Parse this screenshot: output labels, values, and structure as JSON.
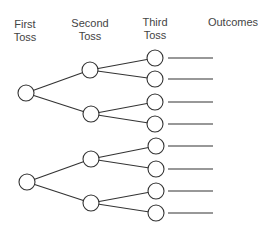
{
  "headers": {
    "first_toss": [
      "First",
      "Toss"
    ],
    "second_toss": [
      "Second",
      "Toss"
    ],
    "third_toss": [
      "Third",
      "Toss"
    ],
    "outcomes": "Outcomes"
  },
  "colors": {
    "stroke": "#333333",
    "node_fill": "#ffffff",
    "text": "#444444"
  },
  "diagram": {
    "type": "probability-tree",
    "node_radius": 8,
    "roots": [
      {
        "pos": [
          26,
          93
        ],
        "children": [
          {
            "pos": [
              90,
              70
            ],
            "children": [
              {
                "pos": [
                  155,
                  58
                ]
              },
              {
                "pos": [
                  155,
                  79
                ]
              }
            ]
          },
          {
            "pos": [
              91,
              114
            ],
            "children": [
              {
                "pos": [
                  155,
                  102
                ]
              },
              {
                "pos": [
                  155,
                  124
                ]
              }
            ]
          }
        ]
      },
      {
        "pos": [
          27,
          182
        ],
        "children": [
          {
            "pos": [
              91,
              159
            ],
            "children": [
              {
                "pos": [
                  156,
                  146
                ]
              },
              {
                "pos": [
                  156,
                  169
                ]
              }
            ]
          },
          {
            "pos": [
              91,
              203
            ],
            "children": [
              {
                "pos": [
                  156,
                  191
                ]
              },
              {
                "pos": [
                  156,
                  213
                ]
              }
            ]
          }
        ]
      }
    ],
    "outcome_line": {
      "x_start": 168,
      "x_end": 213
    },
    "outcome_blanks": [
      "",
      "",
      "",
      "",
      "",
      "",
      "",
      ""
    ]
  }
}
